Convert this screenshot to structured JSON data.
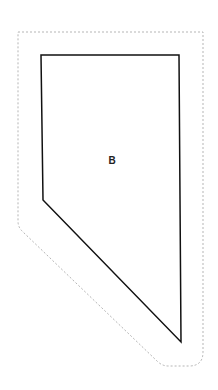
{
  "diagram": {
    "region_label": "B",
    "label_position": [
      112,
      160
    ],
    "inner_polygon": [
      [
        41,
        55
      ],
      [
        179,
        55
      ],
      [
        181,
        342
      ],
      [
        43,
        200
      ]
    ],
    "outer_outline": "M18,32 L203,32 L203,352 Q203,366 189,366 L168,366 L20,228 Z",
    "colors": {
      "inner_stroke": "#111111",
      "outer_stroke": "#b5b5b5",
      "label": "#222222"
    }
  }
}
